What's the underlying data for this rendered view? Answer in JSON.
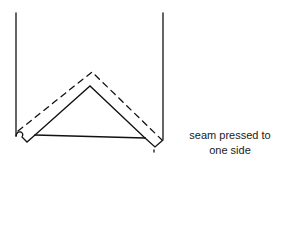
{
  "diagram": {
    "line_color": "#111111",
    "caption": {
      "line1": "seam pressed to",
      "line2": "one side"
    },
    "elements": {
      "left_edge": "fabric edge (left)",
      "right_edge": "fabric edge (right)",
      "seam_fold": "solid V-shaped seam fold",
      "stitch_line": "dashed stitching line",
      "base_line": "seam allowance base"
    }
  }
}
